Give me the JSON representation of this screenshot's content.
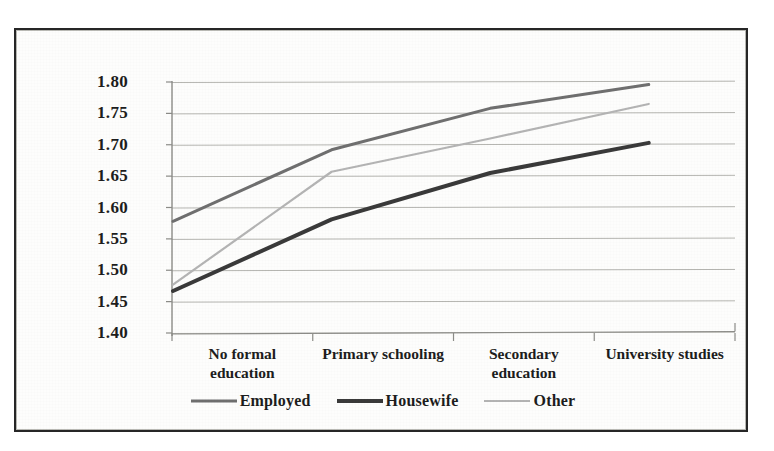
{
  "chart_data": {
    "type": "line",
    "title": "",
    "subtitle": "",
    "xlabel": "",
    "ylabel": "",
    "categories": [
      "No formal\neducation",
      "Primary schooling",
      "Secondary\neducation",
      "University studies"
    ],
    "series": [
      {
        "name": "Employed",
        "values": [
          1.578,
          1.692,
          1.758,
          1.796
        ],
        "color": "#6f6f6f",
        "width": 3.0,
        "dash": "none"
      },
      {
        "name": "Housewife",
        "values": [
          1.467,
          1.581,
          1.655,
          1.703
        ],
        "color": "#3a3a3a",
        "width": 4.0,
        "dash": "none"
      },
      {
        "name": "Other",
        "values": [
          1.477,
          1.657,
          1.71,
          1.765
        ],
        "color": "#b4b4b4",
        "width": 2.2,
        "dash": "none"
      }
    ],
    "ylim": [
      1.4,
      1.8
    ],
    "yticks": [
      1.4,
      1.45,
      1.5,
      1.55,
      1.6,
      1.65,
      1.7,
      1.75,
      1.8
    ],
    "ytick_labels": [
      "1.40",
      "1.45",
      "1.50",
      "1.55",
      "1.60",
      "1.65",
      "1.70",
      "1.75",
      "1.80"
    ],
    "grid": true,
    "grid_axis": "y",
    "legend_position": "bottom"
  },
  "legend": {
    "items": [
      {
        "label": "Employed"
      },
      {
        "label": "Housewife"
      },
      {
        "label": "Other"
      }
    ]
  },
  "axis": {
    "y_tick_0": "1.40",
    "y_tick_1": "1.45",
    "y_tick_2": "1.50",
    "y_tick_3": "1.55",
    "y_tick_4": "1.60",
    "y_tick_5": "1.65",
    "y_tick_6": "1.70",
    "y_tick_7": "1.75",
    "y_tick_8": "1.80",
    "x_tick_0": "No formal\neducation",
    "x_tick_1": "Primary schooling",
    "x_tick_2": "Secondary\neducation",
    "x_tick_3": "University studies"
  },
  "colors": {
    "frame": "#262626",
    "grid": "#a9a9a4",
    "axis": "#8c8c88",
    "text": "#1d1d1d",
    "background": "#fdfdfc",
    "series_employed": "#6f6f6f",
    "series_housewife": "#3a3a3a",
    "series_other": "#b4b4b4"
  }
}
